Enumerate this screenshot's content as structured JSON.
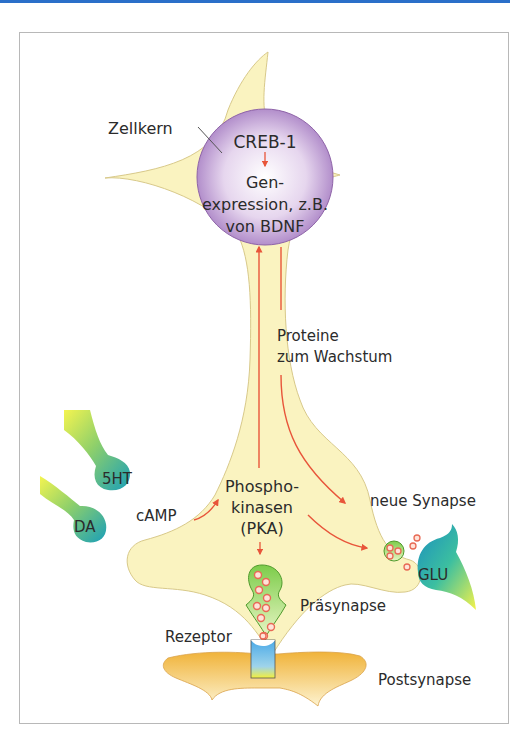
{
  "diagram": {
    "type": "neuron signaling pathway",
    "labels": {
      "nucleus": "Zellkern",
      "creb": "CREB-1",
      "gene_line1": "Gen-",
      "gene_line2": "expression, z.B.",
      "gene_line3": "von BDNF",
      "proteins_line1": "Proteine",
      "proteins_line2": "zum Wachstum",
      "serotonin": "5HT",
      "dopamine": "DA",
      "camp": "cAMP",
      "pka_line1": "Phospho-",
      "pka_line2": "kinasen",
      "pka_line3": "(PKA)",
      "new_synapse": "neue Synapse",
      "glutamate": "GLU",
      "presynapse": "Präsynapse",
      "receptor": "Rezeptor",
      "postsynapse": "Postsynapse"
    },
    "colors": {
      "cell_body": "#faf3c0",
      "cell_outline": "#d8c98a",
      "nucleus": "#b58ccf",
      "arrow": "#e8553a",
      "vesicle_pocket": "#8fd05a",
      "vesicle": "#f0866e",
      "terminal_teal": "#1fa3b4",
      "terminal_yellow": "#f2f04a",
      "postsynapse": "#f3c24a",
      "receptor": "#5fb6e6",
      "frame_border": "#b8b8b8",
      "top_bar": "#2a6fc9"
    }
  }
}
